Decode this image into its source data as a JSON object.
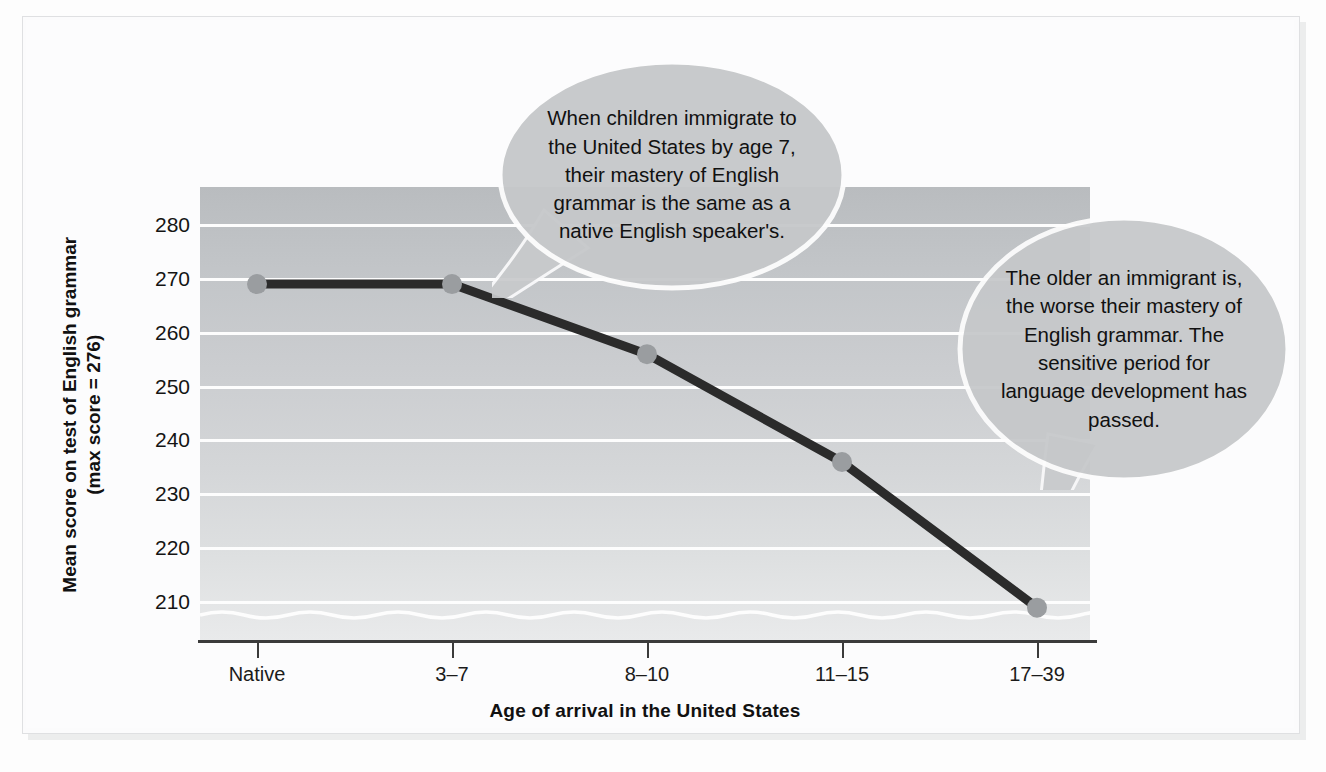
{
  "chart_data": {
    "type": "line",
    "title": "",
    "xlabel": "Age of arrival in the United States",
    "ylabel": "Mean score on test of English grammar",
    "ylabel_line2": "(max score = 276)",
    "categories": [
      "Native",
      "3–7",
      "8–10",
      "11–15",
      "17–39"
    ],
    "values": [
      269,
      269,
      256,
      236,
      209
    ],
    "yticks": [
      280,
      270,
      260,
      250,
      240,
      230,
      220,
      210
    ],
    "ylim": [
      203,
      287
    ],
    "grid": "horizontal",
    "axis_break": true,
    "legend": "none",
    "series": [
      {
        "name": "Mean score on test of English grammar",
        "values": [
          269,
          269,
          256,
          236,
          209
        ]
      }
    ],
    "annotations": [
      {
        "id": "callout-1",
        "text": "When children immigrate to the United States by age 7, their mastery of English grammar is the same as a native English speaker's.",
        "points_to": "3–7"
      },
      {
        "id": "callout-2",
        "text": "The older an immigrant is, the worse their mastery of English grammar. The sensitive period for language development has passed.",
        "points_to": "17–39"
      }
    ],
    "colors": {
      "line": "#2b2b2b",
      "marker": "#9a9da0",
      "plot_background_top": "#b9bcbf",
      "plot_background_bottom": "#e9eaeb",
      "gridline": "#fdfdfd",
      "axis": "#3b3b3b",
      "callout_fill": "#c6c8ca",
      "callout_stroke": "#fdfdfd",
      "text": "#111111"
    }
  }
}
